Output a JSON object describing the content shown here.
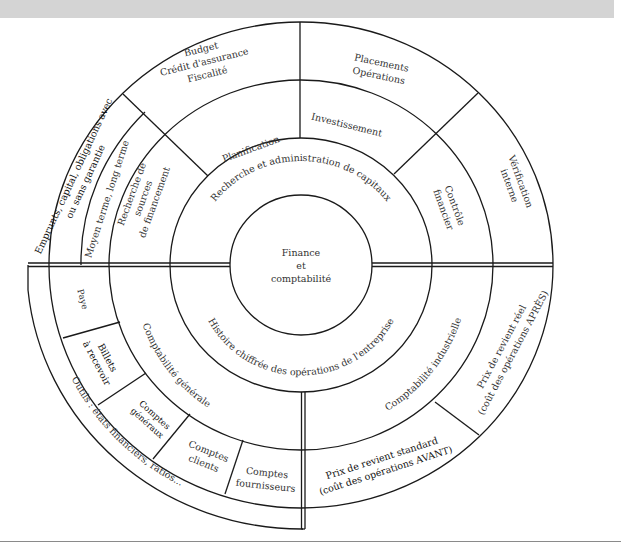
{
  "center": {
    "label_lines": [
      "Finance",
      "et",
      "comptabilité"
    ]
  },
  "upper_half": {
    "inner_ring": "Recherche et administration de capitaux",
    "middle_ring": {
      "left": [
        "Recherche de",
        "sources",
        "de financement"
      ],
      "top_left": "Planification",
      "top_right": "Investissement",
      "right": [
        "Contrôle",
        "financier"
      ]
    },
    "outer_ring": {
      "left_outer": [
        "Emprunts, capital, obligations avec",
        "ou sans garantie"
      ],
      "left_inner": "Moyen terme, long terme",
      "top_left": [
        "Budget",
        "Crédit d'assurance",
        "Fiscalité"
      ],
      "top_right": [
        "Placements",
        "Opérations"
      ],
      "right": [
        "Vérification",
        "interne"
      ]
    }
  },
  "lower_half": {
    "inner_ring": "Histoire chiffrée des opérations de l'entreprise",
    "middle_ring": {
      "left": "Comptabilité générale",
      "right": "Comptabilité industrielle"
    },
    "outer_ring": {
      "left_cells": [
        {
          "lines": [
            "Paye"
          ]
        },
        {
          "lines": [
            "Billets",
            "à recevoir"
          ]
        },
        {
          "lines": [
            "Comptes",
            "généraux"
          ]
        },
        {
          "lines": [
            "Comptes",
            "clients"
          ]
        },
        {
          "lines": [
            "Comptes",
            "fournisseurs"
          ]
        }
      ],
      "right_upper": [
        "Prix de revient réel",
        "(coût des opérations APRÈS)"
      ],
      "right_lower": [
        "Prix de revient standard",
        "(coût des opérations AVANT)"
      ]
    },
    "tools_band": "Outils : états financiers, ratios..."
  },
  "colors": {
    "header_band": "#d4d4d4",
    "line": "#1a1a1a",
    "text": "#333333"
  }
}
